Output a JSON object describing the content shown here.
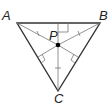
{
  "diagram": {
    "type": "triangle-incenter",
    "vertices": {
      "A": {
        "label": "A"
      },
      "B": {
        "label": "B"
      },
      "C": {
        "label": "C"
      }
    },
    "center_point": {
      "label": "P"
    },
    "colors": {
      "triangle": "#333333",
      "segments": "#555555",
      "point": "#000000"
    }
  }
}
